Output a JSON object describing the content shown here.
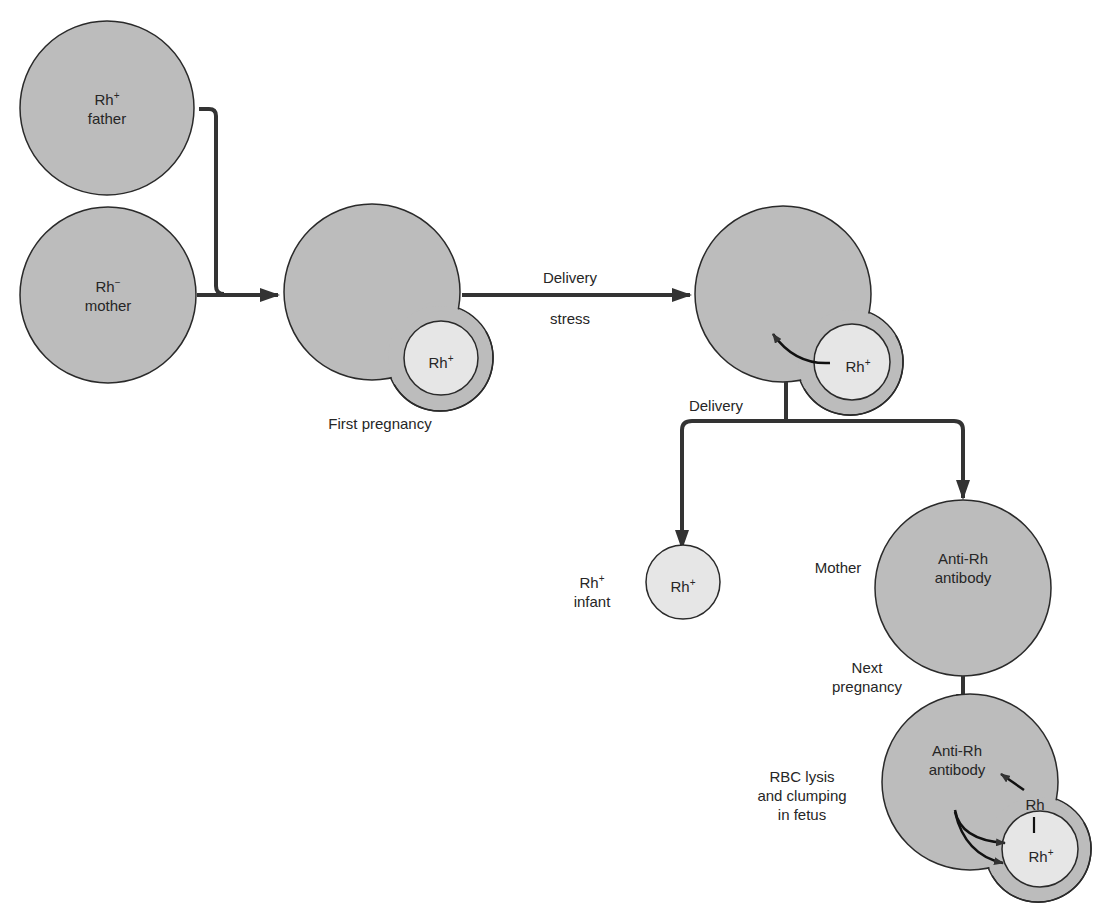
{
  "header_fragment": "...ype ...ty",
  "nodes": {
    "father": {
      "line1": "Rh",
      "sup1": "+",
      "line2": "father"
    },
    "mother": {
      "line1": "Rh",
      "sup1": "−",
      "line2": "mother"
    },
    "first_pregnancy": {
      "fetus": "Rh",
      "fetus_sup": "+",
      "caption": "First pregnancy"
    },
    "delivery_stress": {
      "fetus": "Rh",
      "fetus_sup": "+"
    },
    "infant": {
      "inside": "Rh",
      "inside_sup": "+",
      "label1": "Rh",
      "label1_sup": "+",
      "label2": "infant"
    },
    "mother_antibody": {
      "side_label": "Mother",
      "line1": "Anti-Rh",
      "line2": "antibody"
    },
    "next_pregnancy": {
      "line1": "Anti-Rh",
      "line2": "antibody",
      "rh_label": "Rh",
      "fetus": "Rh",
      "fetus_sup": "+",
      "side1": "RBC lysis",
      "side2": "and clumping",
      "side3": "in fetus"
    }
  },
  "edges": {
    "delivery_top": "Delivery",
    "stress": "stress",
    "delivery_branch": "Delivery",
    "next1": "Next",
    "next2": "pregnancy"
  },
  "colors": {
    "cell_fill": "#bcbcbc",
    "fetus_fill": "#e6e6e6",
    "stroke": "#2a2a2a",
    "arrow": "#333333"
  }
}
